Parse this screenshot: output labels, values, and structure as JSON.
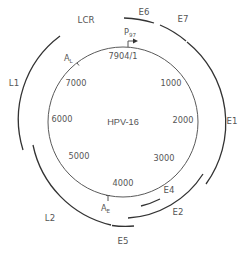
{
  "diagram": {
    "title": "HPV-16",
    "genome_length_label": "7904/1",
    "position_labels": [
      {
        "label": "1000"
      },
      {
        "label": "2000"
      },
      {
        "label": "3000"
      },
      {
        "label": "4000"
      },
      {
        "label": "5000"
      },
      {
        "label": "6000"
      },
      {
        "label": "7000"
      }
    ],
    "promoter": {
      "label": "P",
      "subscript": "97"
    },
    "polyA_sites": [
      {
        "label": "A",
        "subscript": "L"
      },
      {
        "label": "A",
        "subscript": "E"
      }
    ],
    "regions": [
      {
        "label": "LCR"
      }
    ],
    "genes": [
      {
        "label": "E6"
      },
      {
        "label": "E7"
      },
      {
        "label": "E1"
      },
      {
        "label": "E2"
      },
      {
        "label": "E4"
      },
      {
        "label": "E5"
      },
      {
        "label": "L2"
      },
      {
        "label": "L1"
      }
    ],
    "colors": {
      "arc": "#333333",
      "circle": "#5a5a5a",
      "text": "#555555",
      "background": "#ffffff"
    }
  }
}
